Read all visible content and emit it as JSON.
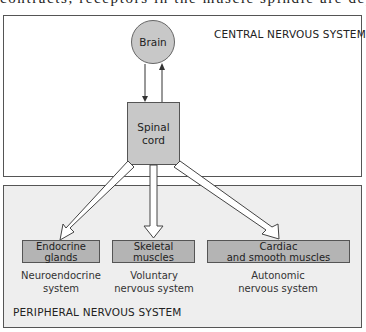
{
  "page_text_above": "contracts, receptors in the muscle spindle are depolarized, a",
  "central": {
    "title": "CENTRAL NERVOUS SYSTEM",
    "brain": "Brain",
    "spinal_cord_line1": "Spinal",
    "spinal_cord_line2": "cord"
  },
  "peripheral": {
    "title": "PERIPHERAL NERVOUS SYSTEM",
    "targets": [
      {
        "line1": "Endocrine",
        "line2": "glands",
        "system_line1": "Neuroendocrine",
        "system_line2": "system"
      },
      {
        "line1": "Skeletal",
        "line2": "muscles",
        "system_line1": "Voluntary",
        "system_line2": "nervous system"
      },
      {
        "line1": "Cardiac",
        "line2": "and smooth muscles",
        "system_line1": "Autonomic",
        "system_line2": "nervous system"
      }
    ]
  },
  "colors": {
    "node_fill": "#c8c8c8",
    "target_fill": "#b4b4b4",
    "pns_background": "#eeeeee"
  }
}
